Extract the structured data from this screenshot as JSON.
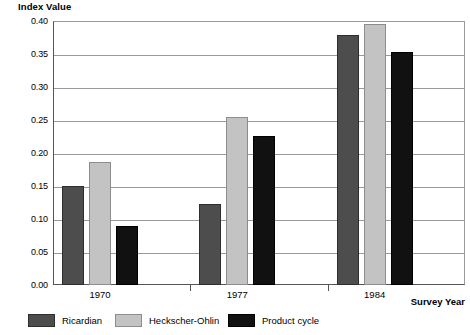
{
  "chart_data": {
    "type": "bar",
    "title": "",
    "xlabel": "Survey Year",
    "ylabel": "Index Value",
    "categories": [
      "1970",
      "1977",
      "1984"
    ],
    "series": [
      {
        "name": "Ricardian",
        "color": "#4d4d4d",
        "values": [
          0.15,
          0.122,
          0.379
        ]
      },
      {
        "name": "Heckscher-Ohlin",
        "color": "#c3c3c3",
        "values": [
          0.187,
          0.255,
          0.395
        ]
      },
      {
        "name": "Product cycle",
        "color": "#111111",
        "values": [
          0.089,
          0.226,
          0.353
        ]
      }
    ],
    "ylim": [
      0.0,
      0.4
    ],
    "yticks": [
      "0.00",
      "0.05",
      "0.10",
      "0.15",
      "0.20",
      "0.25",
      "0.30",
      "0.35",
      "0.40"
    ],
    "ytick_values": [
      0.0,
      0.05,
      0.1,
      0.15,
      0.2,
      0.25,
      0.3,
      0.35,
      0.4
    ],
    "grid": true,
    "legend_position": "bottom"
  }
}
